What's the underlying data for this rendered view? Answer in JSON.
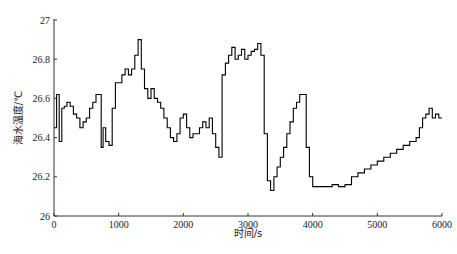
{
  "chart_data": {
    "type": "line",
    "title": "",
    "xlabel": "时间/s",
    "ylabel": "海水温度/℃",
    "xlim": [
      0,
      6000
    ],
    "ylim": [
      26,
      27
    ],
    "xticks": [
      0,
      1000,
      2000,
      3000,
      4000,
      5000,
      6000
    ],
    "xtick_labels": [
      "0",
      "1000",
      "2000",
      "3000",
      "4000",
      "5000",
      "6000"
    ],
    "yticks": [
      26,
      26.2,
      26.4,
      26.6,
      26.8,
      27
    ],
    "ytick_labels": [
      "26",
      "26.2",
      "26.4",
      "26.6",
      "26.8",
      "27"
    ],
    "grid": false,
    "legend": null,
    "series": [
      {
        "name": "海水温度",
        "color": "#000000",
        "x": [
          0,
          40,
          80,
          120,
          160,
          200,
          250,
          300,
          350,
          400,
          450,
          500,
          550,
          600,
          650,
          700,
          730,
          760,
          800,
          850,
          900,
          950,
          1000,
          1050,
          1100,
          1150,
          1200,
          1250,
          1300,
          1350,
          1400,
          1450,
          1500,
          1550,
          1600,
          1650,
          1700,
          1750,
          1800,
          1850,
          1900,
          1950,
          2000,
          2050,
          2100,
          2150,
          2200,
          2250,
          2300,
          2350,
          2400,
          2450,
          2500,
          2550,
          2600,
          2650,
          2700,
          2750,
          2800,
          2850,
          2900,
          2950,
          3000,
          3050,
          3100,
          3150,
          3200,
          3250,
          3300,
          3350,
          3400,
          3450,
          3500,
          3550,
          3600,
          3650,
          3700,
          3750,
          3800,
          3850,
          3900,
          3950,
          4000,
          4100,
          4200,
          4300,
          4400,
          4500,
          4600,
          4700,
          4800,
          4900,
          5000,
          5100,
          5200,
          5300,
          5400,
          5500,
          5600,
          5650,
          5700,
          5750,
          5800,
          5850,
          5900,
          5950,
          6000
        ],
        "values": [
          26.45,
          26.62,
          26.38,
          26.55,
          26.56,
          26.58,
          26.56,
          26.52,
          26.5,
          26.45,
          26.48,
          26.5,
          26.55,
          26.58,
          26.62,
          26.62,
          26.35,
          26.45,
          26.38,
          26.36,
          26.55,
          26.68,
          26.68,
          26.72,
          26.75,
          26.72,
          26.75,
          26.82,
          26.9,
          26.75,
          26.65,
          26.6,
          26.65,
          26.6,
          26.58,
          26.55,
          26.5,
          26.45,
          26.4,
          26.38,
          26.42,
          26.5,
          26.52,
          26.45,
          26.4,
          26.42,
          26.42,
          26.45,
          26.48,
          26.45,
          26.5,
          26.42,
          26.35,
          26.3,
          26.72,
          26.78,
          26.82,
          26.86,
          26.8,
          26.82,
          26.85,
          26.8,
          26.82,
          26.84,
          26.85,
          26.88,
          26.82,
          26.42,
          26.18,
          26.13,
          26.2,
          26.25,
          26.3,
          26.35,
          26.42,
          26.48,
          26.55,
          26.58,
          26.62,
          26.62,
          26.35,
          26.2,
          26.15,
          26.15,
          26.15,
          26.16,
          26.15,
          26.16,
          26.2,
          26.22,
          26.24,
          26.26,
          26.28,
          26.3,
          26.32,
          26.34,
          26.36,
          26.38,
          26.4,
          26.45,
          26.5,
          26.52,
          26.55,
          26.5,
          26.52,
          26.5,
          26.5
        ]
      }
    ]
  }
}
